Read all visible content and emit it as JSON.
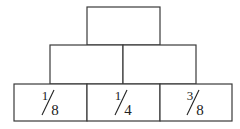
{
  "pyramid": {
    "rows": [
      {
        "cells": [
          {
            "value": null
          }
        ]
      },
      {
        "cells": [
          {
            "value": null
          },
          {
            "value": null
          }
        ]
      },
      {
        "cells": [
          {
            "numerator": "1",
            "denominator": "8"
          },
          {
            "numerator": "1",
            "denominator": "4"
          },
          {
            "numerator": "3",
            "denominator": "8"
          }
        ]
      }
    ]
  }
}
